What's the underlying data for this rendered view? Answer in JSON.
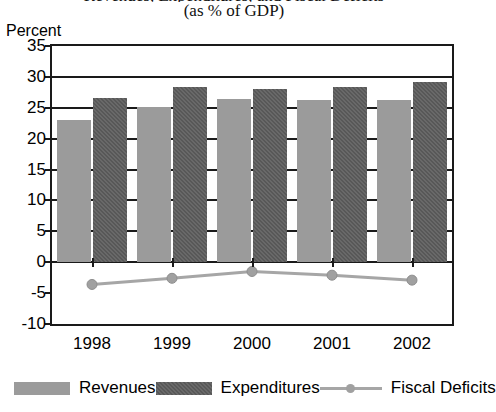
{
  "chart_data": {
    "type": "bar",
    "title": "Revenues, Expenditures, and Fiscal Deficits",
    "subtitle": "(as % of GDP)",
    "xlabel": "",
    "ylabel": "Percent",
    "categories": [
      "1998",
      "1999",
      "2000",
      "2001",
      "2002"
    ],
    "ylim": [
      -10,
      35
    ],
    "ytick_step": 5,
    "yticks": [
      "35",
      "30",
      "25",
      "20",
      "15",
      "10",
      "5",
      "0",
      "-5",
      "-10"
    ],
    "grid": true,
    "legend_position": "bottom",
    "series": [
      {
        "name": "Revenues",
        "type": "bar",
        "color": "#9b9b9b",
        "values": [
          23.0,
          25.2,
          26.5,
          26.3,
          26.2
        ]
      },
      {
        "name": "Expenditures",
        "type": "bar",
        "color": "#585858",
        "values": [
          26.6,
          28.3,
          28.0,
          28.3,
          29.2
        ]
      },
      {
        "name": "Fiscal Deficits",
        "type": "line",
        "color": "#a6a6a6",
        "values": [
          -3.6,
          -2.6,
          -1.5,
          -2.1,
          -2.9
        ]
      }
    ]
  },
  "legend": {
    "items": [
      {
        "label": "Revenues",
        "marker": "bar-swatch-light"
      },
      {
        "label": "Expenditures",
        "marker": "bar-swatch-dark"
      },
      {
        "label": "Fiscal Deficits",
        "marker": "line-with-dot"
      }
    ]
  }
}
